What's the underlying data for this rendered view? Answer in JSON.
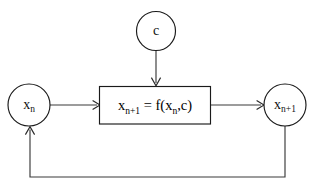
{
  "diagram": {
    "background_color": "#ffffff",
    "stroke_color": "#1a1a1a",
    "text_color": "#111111",
    "nodes": {
      "parameter": {
        "id": "c",
        "shape": "circle",
        "label": "c",
        "label_base": "c",
        "label_subscript": ""
      },
      "state_in": {
        "id": "x_n",
        "shape": "circle",
        "label": "x_n",
        "label_base": "x",
        "label_subscript": "n"
      },
      "state_out": {
        "id": "x_n+1",
        "shape": "circle",
        "label": "x_n+1",
        "label_base": "x",
        "label_subscript": "n+1"
      },
      "map_block": {
        "id": "map",
        "shape": "rectangle",
        "label": "x_n+1 = f(x_n,c)",
        "segments": {
          "lhs_base": "x",
          "lhs_subscript": "n+1",
          "equals": " = ",
          "fn_open": "f(x",
          "fn_subscript": "n",
          "fn_close": ",c)"
        }
      }
    },
    "edges": [
      {
        "id": "edge-c-to-map",
        "from": "c",
        "to": "map",
        "direction": "down",
        "arrowhead": true
      },
      {
        "id": "edge-xn-to-map",
        "from": "x_n",
        "to": "map",
        "direction": "right",
        "arrowhead": true
      },
      {
        "id": "edge-map-to-xn1",
        "from": "map",
        "to": "x_n+1",
        "direction": "right",
        "arrowhead": true
      },
      {
        "id": "edge-feedback",
        "from": "x_n+1",
        "to": "x_n",
        "direction": "loop-bottom",
        "arrowhead": true
      }
    ]
  }
}
